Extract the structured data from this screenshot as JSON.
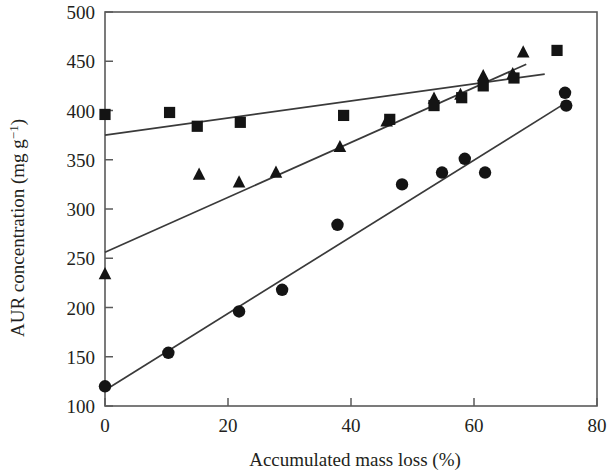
{
  "chart_data": {
    "type": "scatter",
    "title": "",
    "xlabel": "Accumulated mass loss (%)",
    "ylabel_text": "AUR concentration (mg g",
    "ylabel_sup": "−1",
    "ylabel_tail": ")",
    "ylabel_full": "AUR concentration (mg g⁻¹)",
    "xlim": [
      0,
      80
    ],
    "ylim": [
      100,
      500
    ],
    "xticks": [
      0,
      20,
      40,
      60,
      80
    ],
    "yticks": [
      100,
      150,
      200,
      250,
      300,
      350,
      400,
      450,
      500
    ],
    "xtick_labels": [
      "0",
      "20",
      "40",
      "60",
      "80"
    ],
    "ytick_labels": [
      "100",
      "150",
      "200",
      "250",
      "300",
      "350",
      "400",
      "450",
      "500"
    ],
    "grid": false,
    "legend": "none",
    "frame": "box",
    "marker_color": "#141414",
    "line_color": "#3a3a3a",
    "axis_color": "#5a5a5a",
    "series": [
      {
        "name": "Squares",
        "marker": "square",
        "points": [
          [
            0.0,
            396
          ],
          [
            10.5,
            398
          ],
          [
            15.0,
            384
          ],
          [
            22.0,
            388
          ],
          [
            38.8,
            395
          ],
          [
            46.3,
            391
          ],
          [
            53.5,
            405
          ],
          [
            58.0,
            413
          ],
          [
            61.5,
            425
          ],
          [
            66.5,
            433
          ],
          [
            73.5,
            461
          ]
        ],
        "trend": {
          "x0": 0,
          "y0": 375,
          "x1": 71.5,
          "y1": 437
        }
      },
      {
        "name": "Triangles",
        "marker": "triangle",
        "points": [
          [
            0.0,
            234
          ],
          [
            15.3,
            335
          ],
          [
            21.8,
            327
          ],
          [
            27.8,
            337
          ],
          [
            38.2,
            363
          ],
          [
            45.8,
            389
          ],
          [
            53.5,
            412
          ],
          [
            57.8,
            416
          ],
          [
            61.5,
            435
          ],
          [
            66.3,
            437
          ],
          [
            68.0,
            459
          ]
        ],
        "trend": {
          "x0": 0,
          "y0": 256,
          "x1": 68.5,
          "y1": 447
        }
      },
      {
        "name": "Circles",
        "marker": "circle",
        "points": [
          [
            0.0,
            120
          ],
          [
            10.3,
            154
          ],
          [
            21.8,
            196
          ],
          [
            28.8,
            218
          ],
          [
            37.8,
            284
          ],
          [
            48.3,
            325
          ],
          [
            54.8,
            337
          ],
          [
            58.5,
            351
          ],
          [
            61.8,
            337
          ],
          [
            74.8,
            418
          ],
          [
            75.0,
            405
          ]
        ],
        "trend": {
          "x0": 0,
          "y0": 116,
          "x1": 75.5,
          "y1": 410
        }
      }
    ]
  }
}
